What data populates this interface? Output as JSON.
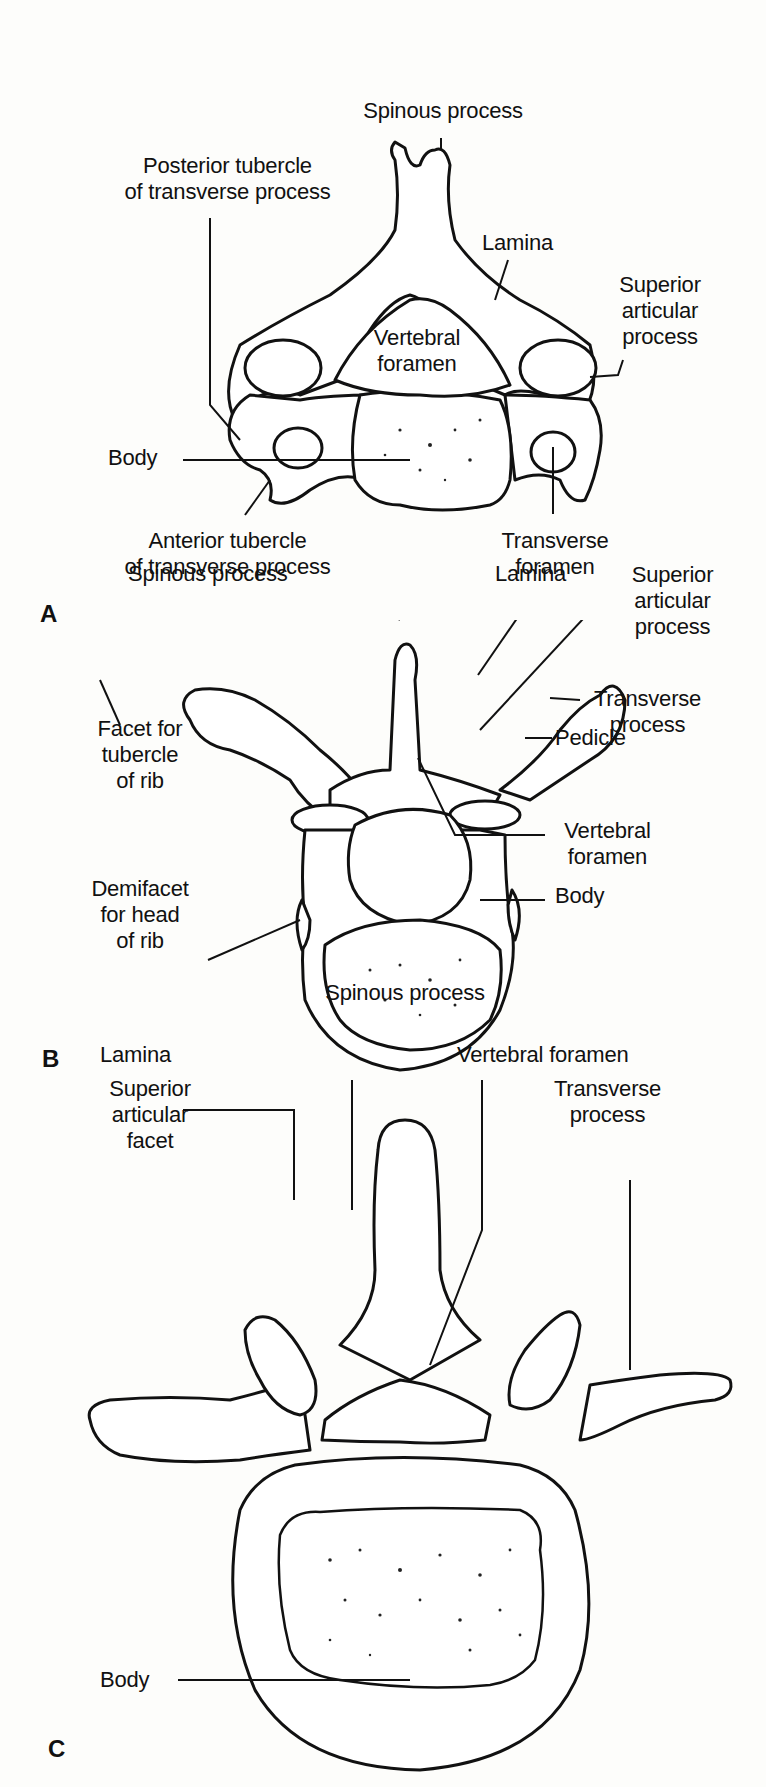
{
  "figure": {
    "panels": [
      {
        "letter": "A",
        "region": "cervical vertebra (superior view)",
        "labels": {
          "spinous_process": "Spinous process",
          "posterior_tubercle": "Posterior tubercle\nof transverse process",
          "lamina": "Lamina",
          "superior_articular_process": "Superior\narticular\nprocess",
          "vertebral_foramen": "Vertebral\nforamen",
          "body": "Body",
          "anterior_tubercle": "Anterior tubercle\nof transverse process",
          "transverse_foramen": "Transverse\nforamen"
        }
      },
      {
        "letter": "B",
        "region": "thoracic vertebra (superior view)",
        "labels": {
          "spinous_process": "Spinous process",
          "lamina": "Lamina",
          "superior_articular_process": "Superior\narticular\nprocess",
          "transverse_process": "Transverse\nprocess",
          "facet_tubercle_rib": "Facet for\ntubercle\nof rib",
          "pedicle": "Pedicle",
          "demifacet_head_rib": "Demifacet\nfor head\nof rib",
          "vertebral_foramen": "Vertebral\nforamen",
          "body": "Body"
        }
      },
      {
        "letter": "C",
        "region": "lumbar vertebra (superior view)",
        "labels": {
          "spinous_process": "Spinous process",
          "lamina": "Lamina",
          "vertebral_foramen": "Vertebral foramen",
          "superior_articular_facet": "Superior\narticular\nfacet",
          "transverse_process": "Transverse\nprocess",
          "body": "Body"
        }
      }
    ]
  }
}
